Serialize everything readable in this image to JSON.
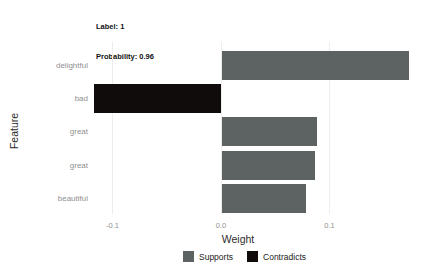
{
  "header": {
    "label": "Label: 1",
    "probability": "Probability: 0.96",
    "explanation_fit": "Explanation Fit: 0.81"
  },
  "chart_data": {
    "type": "bar",
    "orientation": "horizontal",
    "categories": [
      "delightful",
      "bad",
      "great",
      "great",
      "beautiful"
    ],
    "values": [
      0.172,
      -0.117,
      0.088,
      0.086,
      0.077
    ],
    "bar_classes": [
      "supports",
      "contradicts",
      "supports",
      "supports",
      "supports"
    ],
    "colors": {
      "supports": "#5d6362",
      "contradicts": "#100c0c",
      "grid": "#ededed",
      "tick_label": "#909090",
      "axis_title": "#2b2b2b"
    },
    "xlabel": "Weight",
    "ylabel": "Feature",
    "xlim": [
      -0.13,
      0.19
    ],
    "x_ticks": [
      {
        "value": -0.1,
        "label": "-0.1"
      },
      {
        "value": 0,
        "label": "0.0"
      },
      {
        "value": 0.1,
        "label": "0.1"
      }
    ],
    "grid": true,
    "legend": {
      "position": "bottom",
      "items": [
        {
          "label": "Supports",
          "key": "supports"
        },
        {
          "label": "Contradicts",
          "key": "contradicts"
        }
      ]
    }
  }
}
